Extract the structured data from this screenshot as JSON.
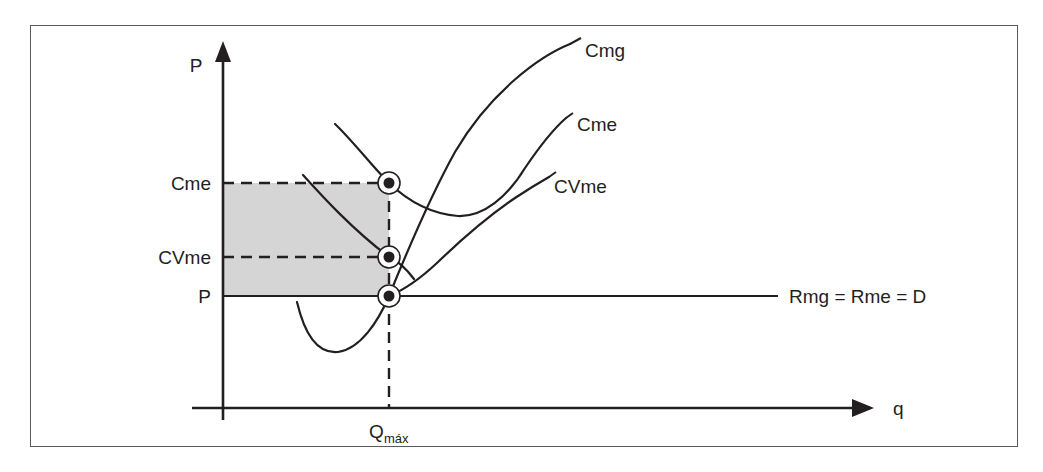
{
  "figure": {
    "axes": {
      "y_axis_label": "P",
      "x_axis_label": "q"
    },
    "price_levels": [
      {
        "key": "cme",
        "label": "Cme",
        "y": 183,
        "dashed": true
      },
      {
        "key": "cvme",
        "label": "CVme",
        "y": 257,
        "dashed": true
      },
      {
        "key": "p",
        "label": "P",
        "y": 296,
        "dashed": false
      }
    ],
    "quantity_label": {
      "base": "Q",
      "subscript": "máx"
    },
    "curve_labels": [
      {
        "key": "cmg",
        "label": "Cmg",
        "x": 585,
        "y": 50
      },
      {
        "key": "cme",
        "label": "Cme",
        "x": 575,
        "y": 125
      },
      {
        "key": "cvme",
        "label": "CVme",
        "x": 552,
        "y": 187
      }
    ],
    "demand_label": "Rmg = Rme = D",
    "shaded_region": {
      "name": "loss-area",
      "color": "#d5d5d5",
      "x": 222,
      "y": 183,
      "width": 167,
      "height": 113
    },
    "equilibrium_points": [
      {
        "key": "point-cme",
        "x": 389,
        "y": 183
      },
      {
        "key": "point-cvme",
        "x": 389,
        "y": 257
      },
      {
        "key": "point-p",
        "x": 389,
        "y": 296
      }
    ],
    "colors": {
      "border": "#58585a",
      "line": "#231f20",
      "text": "#231f20",
      "shade": "#d5d5d5"
    }
  }
}
